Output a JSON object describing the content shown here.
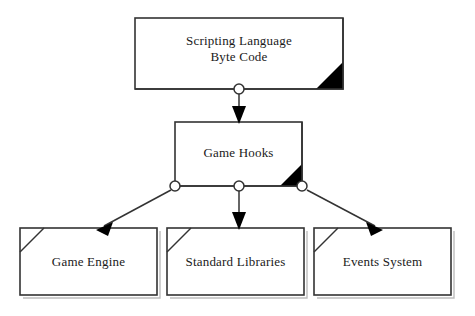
{
  "diagram": {
    "type": "uml-component-diagram",
    "colors": {
      "stroke": "#333333",
      "fill": "#ffffff",
      "accent": "#000000",
      "text": "#1a1a1a"
    },
    "nodes": [
      {
        "id": "scripting-language-byte-code",
        "label": "Scripting Language\nByte Code",
        "x": 135,
        "y": 18,
        "width": 208,
        "height": 71,
        "corner_marker": "filled-triangle-bottom-right"
      },
      {
        "id": "game-hooks",
        "label": "Game Hooks",
        "x": 175,
        "y": 122,
        "width": 127,
        "height": 64,
        "corner_marker": "filled-triangle-bottom-right"
      },
      {
        "id": "game-engine",
        "label": "Game Engine",
        "x": 20,
        "y": 228,
        "width": 137,
        "height": 67,
        "corner_marker": "cut-corner-top-left"
      },
      {
        "id": "standard-libraries",
        "label": "Standard Libraries",
        "x": 167,
        "y": 228,
        "width": 137,
        "height": 67,
        "corner_marker": "cut-corner-top-left"
      },
      {
        "id": "events-system",
        "label": "Events System",
        "x": 314,
        "y": 228,
        "width": 137,
        "height": 67,
        "corner_marker": "cut-corner-top-left"
      }
    ],
    "ports": [
      {
        "id": "port-byte-code-out",
        "cx": 239,
        "cy": 89,
        "r": 5
      },
      {
        "id": "port-game-hooks-left",
        "cx": 175,
        "cy": 186,
        "r": 5
      },
      {
        "id": "port-game-hooks-center",
        "cx": 239,
        "cy": 186,
        "r": 5
      },
      {
        "id": "port-game-hooks-right",
        "cx": 302,
        "cy": 186,
        "r": 5
      }
    ],
    "connectors": [
      {
        "id": "connector-byte-code-to-game-hooks",
        "from": "scripting-language-byte-code",
        "to": "game-hooks",
        "from_port": "port-byte-code-out",
        "path": "M 239 94 L 239 122",
        "arrowhead": "filled-triangle"
      },
      {
        "id": "connector-game-hooks-to-game-engine",
        "from": "game-hooks",
        "to": "game-engine",
        "from_port": "port-game-hooks-left",
        "path": "M 171 190 L 99 228",
        "arrowhead": "filled-triangle"
      },
      {
        "id": "connector-game-hooks-to-standard-libraries",
        "from": "game-hooks",
        "to": "standard-libraries",
        "from_port": "port-game-hooks-center",
        "path": "M 239 191 L 239 228",
        "arrowhead": "filled-triangle"
      },
      {
        "id": "connector-game-hooks-to-events-system",
        "from": "game-hooks",
        "to": "events-system",
        "from_port": "port-game-hooks-right",
        "path": "M 307 190 L 380 228",
        "arrowhead": "filled-triangle"
      }
    ]
  }
}
